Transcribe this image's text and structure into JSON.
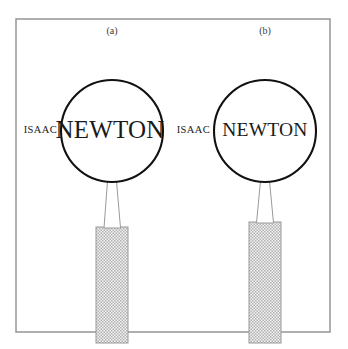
{
  "figure": {
    "background_color": "#ffffff",
    "width": 348,
    "height": 349,
    "frame": {
      "name": "figure-border",
      "x": 16,
      "y": 19,
      "width": 314,
      "height": 313,
      "stroke_color": "#8e8e8e"
    },
    "panels": [
      {
        "key": "a",
        "label": "(a)",
        "label_x": 112,
        "label_y": 32,
        "outside_text": "ISAAC",
        "outside_text_x": 57,
        "outside_text_y": 131,
        "lens_text": "NEWTON",
        "lens_text_size_class": "newton-a",
        "lens": {
          "cx": 112,
          "cy": 131,
          "r": 51,
          "fill": "#ffffff",
          "stroke_color": "#111111"
        },
        "stem": {
          "top_left_x": 107.5,
          "top_right_x": 116.5,
          "top_y": 181,
          "bottom_left_x": 104,
          "bottom_right_x": 120.5,
          "bottom_y": 228
        },
        "handle": {
          "x": 96,
          "y": 227,
          "width": 32,
          "height": 116,
          "hatch_color": "#b5b5b5",
          "base_color": "#f2f2f2"
        }
      },
      {
        "key": "b",
        "label": "(b)",
        "label_x": 265,
        "label_y": 32,
        "outside_text": "ISAAC",
        "outside_text_x": 210,
        "outside_text_y": 131,
        "lens_text": "NEWTON",
        "lens_text_size_class": "newton-b",
        "lens": {
          "cx": 265,
          "cy": 131,
          "r": 51,
          "fill": "#ffffff",
          "stroke_color": "#111111"
        },
        "stem": {
          "top_left_x": 260.5,
          "top_right_x": 269.5,
          "top_y": 181,
          "bottom_left_x": 256.5,
          "bottom_right_x": 273.5,
          "bottom_y": 223
        },
        "handle": {
          "x": 249,
          "y": 222,
          "width": 32,
          "height": 121,
          "hatch_color": "#b5b5b5",
          "base_color": "#f2f2f2"
        }
      }
    ],
    "colors": {
      "ink": "#1a1a1a",
      "lens_stroke": "#111111",
      "frame_stroke": "#8e8e8e",
      "hatch": "#b5b5b5",
      "canvas": "#ffffff"
    }
  }
}
